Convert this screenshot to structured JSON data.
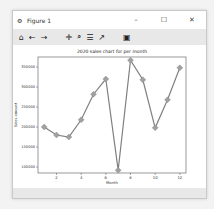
{
  "window": {
    "title": "Figure 1",
    "controls": {
      "minimize": "–",
      "maximize": "☐",
      "close": "✕"
    }
  },
  "toolbar": {
    "items": [
      {
        "name": "home-icon",
        "glyph": "⌂"
      },
      {
        "name": "back-icon",
        "glyph": "←"
      },
      {
        "name": "forward-icon",
        "glyph": "→"
      },
      {
        "name": "pan-icon",
        "glyph": "✛"
      },
      {
        "name": "zoom-icon",
        "glyph": "⌕"
      },
      {
        "name": "configure-subplots-icon",
        "glyph": "☰"
      },
      {
        "name": "edit-axes-icon",
        "glyph": "↗"
      },
      {
        "name": "save-icon",
        "glyph": "▣"
      }
    ]
  },
  "chart_data": {
    "type": "line",
    "title": "2020 sales chart for per month",
    "xlabel": "Month",
    "ylabel": "Sales amount",
    "x": [
      1,
      2,
      3,
      4,
      5,
      6,
      7,
      8,
      9,
      10,
      11,
      12
    ],
    "values": [
      200000,
      180000,
      175000,
      218000,
      282000,
      320000,
      92000,
      367000,
      318000,
      198000,
      268000,
      348000
    ],
    "xticks": [
      2,
      4,
      6,
      8,
      10,
      12
    ],
    "yticks": [
      100000,
      150000,
      200000,
      250000,
      300000,
      350000
    ],
    "xlim": [
      0.5,
      12.5
    ],
    "ylim": [
      85000,
      375000
    ],
    "grid": false,
    "line_color": "#7f7f7f",
    "marker": "diamond",
    "marker_color": "#a0a0a0"
  }
}
